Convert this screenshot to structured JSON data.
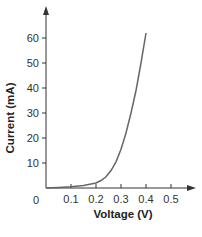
{
  "chart_data": {
    "type": "line",
    "title": "",
    "xlabel": "Voltage (V)",
    "ylabel": "Current (mA)",
    "xlim": [
      0,
      0.55
    ],
    "ylim": [
      0,
      68
    ],
    "grid": false,
    "legend": null,
    "origin_label": "0",
    "x_ticks": [
      0.1,
      0.2,
      0.3,
      0.4,
      0.5
    ],
    "x_tick_labels": [
      "0.1",
      "0.2",
      "0.3",
      "0.4",
      "0.5"
    ],
    "y_ticks": [
      10,
      20,
      30,
      40,
      50,
      60
    ],
    "y_tick_labels": [
      "10",
      "20",
      "30",
      "40",
      "50",
      "60"
    ],
    "series": [
      {
        "name": "I-V curve",
        "color": "#666666",
        "x": [
          0.0,
          0.05,
          0.1,
          0.15,
          0.2,
          0.22,
          0.24,
          0.26,
          0.28,
          0.3,
          0.32,
          0.34,
          0.36,
          0.38,
          0.4
        ],
        "y": [
          0.0,
          0.2,
          0.5,
          1.0,
          2.0,
          3.0,
          4.5,
          7.0,
          10.5,
          15.5,
          22.0,
          30.0,
          39.0,
          50.0,
          62.0
        ]
      }
    ]
  }
}
